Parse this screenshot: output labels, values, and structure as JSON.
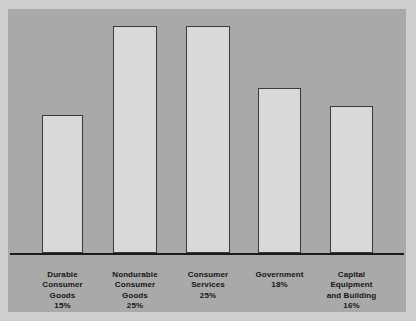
{
  "chart_data": {
    "type": "bar",
    "title": "",
    "subtitle": "",
    "xlabel": "",
    "ylabel": "",
    "grid": false,
    "legend": "none",
    "ylim": [
      0,
      27
    ],
    "categories": [
      "Durable\nConsumer\nGoods",
      "Nondurable\nConsumer\nGoods",
      "Consumer\nServices",
      "Government",
      "Capital\nEquipment\nand Building"
    ],
    "value_labels": [
      "15%",
      "25%",
      "25%",
      "18%",
      "16%"
    ],
    "values": [
      15,
      25,
      25,
      18,
      16
    ],
    "units": "percent",
    "bars": [
      {
        "label": "Durable\nConsumer\nGoods",
        "value": 15,
        "value_label": "15%",
        "left_px": 34,
        "width_px": 41,
        "height_px": 138
      },
      {
        "label": "Nondurable\nConsumer\nGoods",
        "value": 25,
        "value_label": "25%",
        "left_px": 105,
        "width_px": 44,
        "height_px": 227
      },
      {
        "label": "Consumer\nServices",
        "value": 25,
        "value_label": "25%",
        "left_px": 178,
        "width_px": 44,
        "height_px": 227
      },
      {
        "label": "Government",
        "value": 18,
        "value_label": "18%",
        "left_px": 250,
        "width_px": 43,
        "height_px": 165
      },
      {
        "label": "Capital\nEquipment\nand Building",
        "value": 16,
        "value_label": "16%",
        "left_px": 322,
        "width_px": 43,
        "height_px": 147
      }
    ]
  },
  "style": {
    "page_background": "#cfcfcf",
    "panel_background": "#a9a9a9",
    "bar_fill": "#d9d9d9",
    "bar_stroke": "#3a3a3a",
    "axis_color": "#1b1b1b",
    "text_color": "#151515"
  }
}
